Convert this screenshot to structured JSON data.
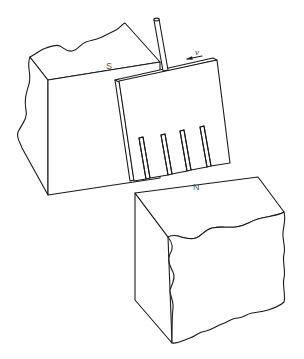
{
  "diagram": {
    "labels": {
      "south_pole": "S",
      "north_pole": "N",
      "velocity": "v"
    },
    "colors": {
      "line": "#1a1a1a",
      "label": "#555555",
      "background": "#ffffff"
    },
    "plate": {
      "slot_count": 4
    }
  }
}
